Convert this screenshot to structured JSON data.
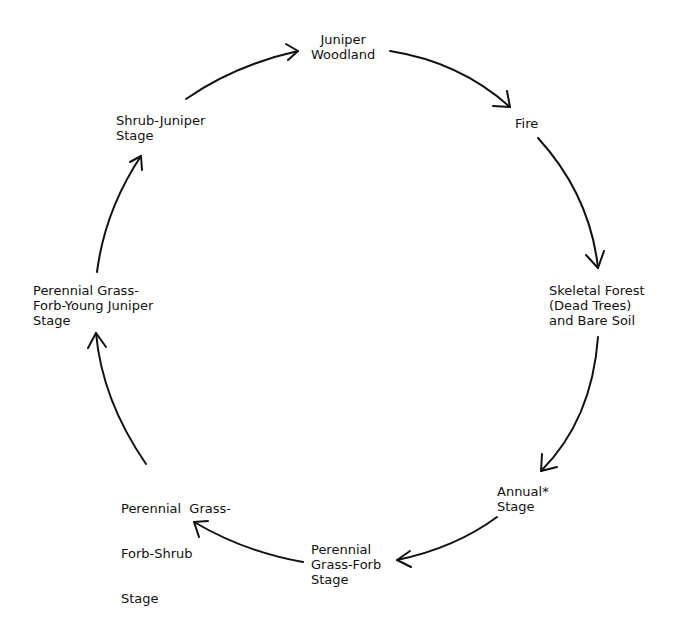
{
  "diagram": {
    "type": "cycle",
    "line_color": "#111111",
    "background": "#ffffff",
    "nodes": [
      {
        "id": "juniper-woodland",
        "lines": [
          "Juniper",
          "Woodland"
        ]
      },
      {
        "id": "fire",
        "lines": [
          "Fire"
        ]
      },
      {
        "id": "skeletal-forest",
        "lines": [
          "Skeletal Forest",
          "(Dead Trees)",
          "and Bare Soil"
        ]
      },
      {
        "id": "annual-stage",
        "lines": [
          "Annual*",
          "Stage"
        ]
      },
      {
        "id": "perennial-grass-forb",
        "lines": [
          "Perennial",
          "Grass-Forb",
          "Stage"
        ]
      },
      {
        "id": "perennial-grass-forb-shrub",
        "lines": [
          "Perennial  Grass-",
          "Forb-Shrub",
          "Stage"
        ]
      },
      {
        "id": "perennial-grass-forb-young-juniper",
        "lines": [
          "Perennial Grass-",
          "Forb-Young Juniper",
          "Stage"
        ]
      },
      {
        "id": "shrub-juniper",
        "lines": [
          "Shrub-Juniper",
          "Stage"
        ]
      }
    ],
    "edges": [
      {
        "from": "juniper-woodland",
        "to": "fire"
      },
      {
        "from": "fire",
        "to": "skeletal-forest"
      },
      {
        "from": "skeletal-forest",
        "to": "annual-stage"
      },
      {
        "from": "annual-stage",
        "to": "perennial-grass-forb"
      },
      {
        "from": "perennial-grass-forb",
        "to": "perennial-grass-forb-shrub"
      },
      {
        "from": "perennial-grass-forb-shrub",
        "to": "perennial-grass-forb-young-juniper"
      },
      {
        "from": "perennial-grass-forb-young-juniper",
        "to": "shrub-juniper"
      },
      {
        "from": "shrub-juniper",
        "to": "juniper-woodland"
      }
    ]
  }
}
